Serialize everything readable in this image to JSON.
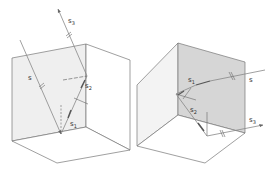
{
  "figure": {
    "colors": {
      "edge": "#777777",
      "ray": "#888888",
      "shaded_face": "#d6d6d6",
      "light_face": "#efefef"
    },
    "left_panel": {
      "labels": {
        "s": "s",
        "s1": "s",
        "s1_sub": "1",
        "s2": "s",
        "s2_sub": "2",
        "s3": "s",
        "s3_sub": "3"
      }
    },
    "right_panel": {
      "labels": {
        "s": "s",
        "s1": "s",
        "s1_sub": "1",
        "s2": "s",
        "s2_sub": "2",
        "s3": "s",
        "s3_sub": "3"
      }
    }
  }
}
